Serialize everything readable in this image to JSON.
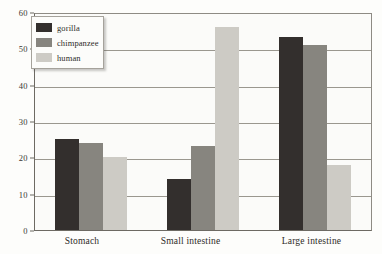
{
  "chart_data": {
    "type": "bar",
    "title": "",
    "xlabel": "",
    "ylabel": "",
    "ylim": [
      0,
      60
    ],
    "yticks": [
      0,
      10,
      20,
      30,
      40,
      50,
      60
    ],
    "grid": true,
    "legend_position": "top-left",
    "categories": [
      "Stomach",
      "Small intestine",
      "Large intestine"
    ],
    "series": [
      {
        "name": "gorilla",
        "color": "#332f2d",
        "values": [
          25,
          14,
          53
        ]
      },
      {
        "name": "chimpanzee",
        "color": "#87857f",
        "values": [
          24,
          23,
          51
        ]
      },
      {
        "name": "human",
        "color": "#cdcbc5",
        "values": [
          20,
          56,
          18
        ]
      }
    ]
  },
  "legend": {
    "items": [
      {
        "label": "gorilla"
      },
      {
        "label": "chimpanzee"
      },
      {
        "label": "human"
      }
    ]
  },
  "axis": {
    "ytick_labels": [
      "60",
      "50",
      "40",
      "30",
      "20",
      "10",
      "0"
    ]
  }
}
